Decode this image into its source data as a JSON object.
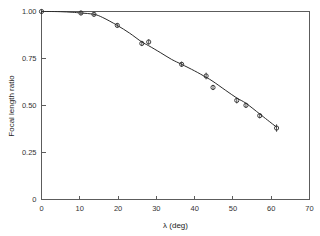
{
  "chart_data": {
    "type": "scatter",
    "title": "",
    "xlabel": "λ  (deg)",
    "ylabel": "Focal length ratio",
    "xlim": [
      0,
      70
    ],
    "ylim": [
      0,
      1.0
    ],
    "xticks": [
      0,
      10,
      20,
      30,
      40,
      50,
      60,
      70
    ],
    "xtick_labels": [
      "0",
      "10",
      "20",
      "30",
      "40",
      "50",
      "60",
      "70"
    ],
    "yticks": [
      0,
      0.25,
      0.5,
      0.75,
      1.0
    ],
    "ytick_labels": [
      "0",
      "0.25",
      "0.50",
      "0.75",
      "1.00"
    ],
    "grid": false,
    "legend": false,
    "marker": "open-circle",
    "error_bars": true,
    "x": [
      0.0,
      10.3,
      13.7,
      19.8,
      26.2,
      28.0,
      36.6,
      43.0,
      44.8,
      51.0,
      53.4,
      57.0,
      61.4
    ],
    "y": [
      1.0,
      0.992,
      0.985,
      0.926,
      0.83,
      0.838,
      0.719,
      0.657,
      0.596,
      0.527,
      0.501,
      0.446,
      0.38
    ],
    "yerr": [
      0.012,
      0.012,
      0.012,
      0.012,
      0.014,
      0.014,
      0.014,
      0.018,
      0.014,
      0.016,
      0.014,
      0.014,
      0.02
    ],
    "curve_x": [
      0,
      2,
      5,
      8,
      10.3,
      13.7,
      16,
      19.8,
      23,
      26.2,
      28,
      31,
      34,
      36.6,
      40,
      43,
      44.8,
      48,
      51,
      53.4,
      57,
      59,
      61.4
    ],
    "curve_y": [
      1.0,
      1.0,
      0.999,
      0.996,
      0.992,
      0.985,
      0.968,
      0.926,
      0.885,
      0.838,
      0.818,
      0.782,
      0.745,
      0.719,
      0.684,
      0.65,
      0.628,
      0.582,
      0.54,
      0.512,
      0.455,
      0.423,
      0.385
    ]
  },
  "colors": {
    "axis": "#5c5c5c",
    "data": "#2b2b2b",
    "background": "#ffffff",
    "text": "#333333"
  }
}
